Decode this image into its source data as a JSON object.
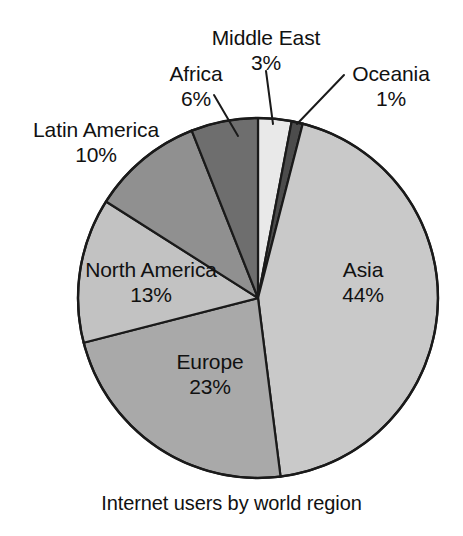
{
  "chart_data": {
    "type": "pie",
    "title": "Internet users by world region",
    "caption": "Internet users by world region",
    "unit": "%",
    "total": 100,
    "start_angle_deg": 0,
    "direction": "clockwise",
    "categories": [
      "Middle East",
      "Oceania",
      "Asia",
      "Europe",
      "North America",
      "Latin America",
      "Africa"
    ],
    "values": [
      3,
      1,
      44,
      23,
      13,
      10,
      6
    ],
    "legend": "none",
    "labels_position": "inside-and-callout",
    "slices": [
      {
        "name": "Middle East",
        "label": "Middle East",
        "value": 3,
        "pct_text": "3%",
        "color": "#e9e9e9",
        "label_placement": "callout",
        "start_deg": 0,
        "end_deg": 10.8
      },
      {
        "name": "Oceania",
        "label": "Oceania",
        "value": 1,
        "pct_text": "1%",
        "color": "#4c4c4c",
        "label_placement": "callout",
        "start_deg": 10.8,
        "end_deg": 14.4
      },
      {
        "name": "Asia",
        "label": "Asia",
        "value": 44,
        "pct_text": "44%",
        "color": "#c9c9c9",
        "label_placement": "inside",
        "start_deg": 14.4,
        "end_deg": 172.8
      },
      {
        "name": "Europe",
        "label": "Europe",
        "value": 23,
        "pct_text": "23%",
        "color": "#a9a9a9",
        "label_placement": "inside",
        "start_deg": 172.8,
        "end_deg": 255.6
      },
      {
        "name": "North America",
        "label": "North America",
        "value": 13,
        "pct_text": "13%",
        "color": "#c2c2c2",
        "label_placement": "inside",
        "start_deg": 255.6,
        "end_deg": 302.4
      },
      {
        "name": "Latin America",
        "label": "Latin America",
        "value": 10,
        "pct_text": "10%",
        "color": "#909090",
        "label_placement": "callout",
        "start_deg": 302.4,
        "end_deg": 338.4
      },
      {
        "name": "Africa",
        "label": "Africa",
        "value": 6,
        "pct_text": "6%",
        "color": "#6e6e6e",
        "label_placement": "callout",
        "start_deg": 338.4,
        "end_deg": 360
      }
    ]
  },
  "labels": {
    "middle_east": {
      "name": "Middle East",
      "pct": "3%"
    },
    "oceania": {
      "name": "Oceania",
      "pct": "1%"
    },
    "africa": {
      "name": "Africa",
      "pct": "6%"
    },
    "latin_america": {
      "name": "Latin America",
      "pct": "10%"
    },
    "north_america": {
      "name": "North America",
      "pct": "13%"
    },
    "europe": {
      "name": "Europe",
      "pct": "23%"
    },
    "asia": {
      "name": "Asia",
      "pct": "44%"
    }
  },
  "caption": "Internet users by world region",
  "colors": {
    "background": "#ffffff",
    "text": "#111111",
    "outline": "#1a1a1a",
    "middle_east": "#e9e9e9",
    "oceania": "#4c4c4c",
    "asia": "#c9c9c9",
    "europe": "#a9a9a9",
    "north_america": "#c2c2c2",
    "latin_america": "#909090",
    "africa": "#6e6e6e"
  }
}
